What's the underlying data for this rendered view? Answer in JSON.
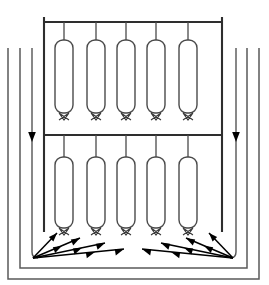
{
  "figure": {
    "type": "line-art schematic",
    "canvas": {
      "width": 269,
      "height": 285
    },
    "background_color": "#ffffff",
    "line_color": "#3a3a3a",
    "arrow_color": "#000000"
  },
  "vessel": {
    "outer_wall": {
      "left_x": 8,
      "right_x": 259,
      "top_y": 48,
      "bottom_y": 279
    },
    "inner_wall": {
      "left_x": 20,
      "right_x": 247,
      "top_y": 48,
      "bottom_y": 268
    },
    "label": "vessel shell"
  },
  "support": {
    "left_post_x": 44,
    "right_post_x": 222,
    "post_top_y": 17,
    "post_bottom_y": 232,
    "upper_header_y": 22,
    "lower_header_y": 135,
    "label": "tube support header"
  },
  "tube_banks": [
    {
      "name": "upper-bank",
      "count": 5,
      "stem_top_y": 22,
      "tube_top_y": 40,
      "tube_bottom_y": 113,
      "tube_width": 18,
      "corner_radius": 8,
      "centers_x": [
        64,
        96,
        126,
        156,
        188
      ]
    },
    {
      "name": "lower-bank",
      "count": 5,
      "stem_top_y": 135,
      "tube_top_y": 157,
      "tube_bottom_y": 228,
      "tube_width": 18,
      "corner_radius": 8,
      "centers_x": [
        64,
        96,
        126,
        156,
        188
      ]
    }
  ],
  "downflow": {
    "left_x": 32,
    "right_x": 236,
    "top_y": 48,
    "arrow_y": 135,
    "turn_y": 252,
    "label": "downward recirculation flow"
  },
  "flow_fans": [
    {
      "name": "left-fan",
      "origin_x": 33,
      "origin_y": 258,
      "direction": "right-and-up",
      "rays": [
        {
          "tip_x": 57,
          "tip_y": 233
        },
        {
          "tip_x": 80,
          "tip_y": 238
        },
        {
          "tip_x": 105,
          "tip_y": 243
        },
        {
          "tip_x": 124,
          "tip_y": 249
        }
      ]
    },
    {
      "name": "right-fan",
      "origin_x": 233,
      "origin_y": 258,
      "direction": "left-and-up",
      "rays": [
        {
          "tip_x": 209,
          "tip_y": 233
        },
        {
          "tip_x": 186,
          "tip_y": 238
        },
        {
          "tip_x": 161,
          "tip_y": 243
        },
        {
          "tip_x": 142,
          "tip_y": 249
        }
      ]
    }
  ],
  "nozzle": {
    "shape": "inverted-v-fork",
    "half_width": 5,
    "depth": 7,
    "label": "tube bottom nozzle"
  }
}
